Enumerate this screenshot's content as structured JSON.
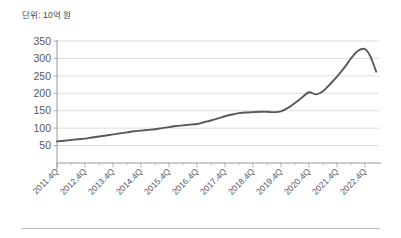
{
  "figure": {
    "unit_label": "단위: 10억 원",
    "line_color": "#595959",
    "grid_color": "#cfcfcf",
    "axis_color": "#9a9a9a",
    "background": "#ffffff"
  },
  "chart_data": {
    "type": "line",
    "title": "",
    "subtitle": "",
    "xlabel": "",
    "ylabel": "",
    "annotations": [
      "단위: 10억 원"
    ],
    "grid": "horizontal",
    "legend": "none",
    "ylim": [
      0,
      350
    ],
    "ytick_values": [
      0,
      50,
      100,
      150,
      200,
      250,
      300,
      350
    ],
    "ytick_labels": [
      "",
      "50",
      "100",
      "150",
      "200",
      "250",
      "300",
      "350"
    ],
    "xtick_labels": [
      "2011.4Q",
      "2012.4Q",
      "2013.4Q",
      "2014.4Q",
      "2015.4Q",
      "2016.4Q",
      "2017.4Q",
      "2018.4Q",
      "2019.4Q",
      "2020.4Q",
      "2021.4Q",
      "2022.4Q"
    ],
    "x": [
      "2011.4Q",
      "2012.1Q",
      "2012.2Q",
      "2012.3Q",
      "2012.4Q",
      "2013.1Q",
      "2013.2Q",
      "2013.3Q",
      "2013.4Q",
      "2014.1Q",
      "2014.2Q",
      "2014.3Q",
      "2014.4Q",
      "2015.1Q",
      "2015.2Q",
      "2015.3Q",
      "2015.4Q",
      "2016.1Q",
      "2016.2Q",
      "2016.3Q",
      "2016.4Q",
      "2017.1Q",
      "2017.2Q",
      "2017.3Q",
      "2017.4Q",
      "2018.1Q",
      "2018.2Q",
      "2018.3Q",
      "2018.4Q",
      "2019.1Q",
      "2019.2Q",
      "2019.3Q",
      "2019.4Q",
      "2020.1Q",
      "2020.2Q",
      "2020.3Q",
      "2020.4Q",
      "2021.1Q",
      "2021.2Q",
      "2021.3Q",
      "2021.4Q",
      "2022.1Q",
      "2022.2Q",
      "2022.3Q",
      "2022.4Q"
    ],
    "values": [
      62,
      64,
      66,
      68,
      70,
      73,
      76,
      79,
      82,
      85,
      88,
      91,
      93,
      95,
      97,
      100,
      103,
      106,
      108,
      110,
      112,
      117,
      122,
      128,
      134,
      139,
      143,
      145,
      146,
      147,
      147,
      146,
      148,
      158,
      172,
      188,
      203,
      197,
      206,
      226,
      248,
      272,
      300,
      322,
      327
    ],
    "series": [
      {
        "name": "",
        "values": [
          62,
          64,
          66,
          68,
          70,
          73,
          76,
          79,
          82,
          85,
          88,
          91,
          93,
          95,
          97,
          100,
          103,
          106,
          108,
          110,
          112,
          117,
          122,
          128,
          134,
          139,
          143,
          145,
          146,
          147,
          147,
          146,
          148,
          158,
          172,
          188,
          203,
          197,
          206,
          226,
          248,
          272,
          300,
          322,
          327
        ]
      }
    ],
    "final_segment_note": {
      "peak_value": 327,
      "end_value": 262
    }
  }
}
